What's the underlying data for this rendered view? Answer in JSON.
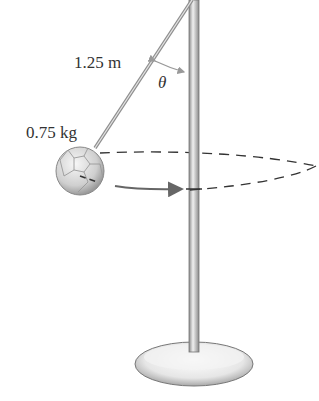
{
  "diagram": {
    "type": "conical-pendulum",
    "labels": {
      "length": "1.25 m",
      "mass": "0.75 kg",
      "angle": "θ"
    },
    "colors": {
      "background": "#ffffff",
      "pole": "#bdbdbd",
      "pole_edge": "#7a7a7a",
      "rope": "#9a9a9a",
      "ball": "#d9d9d9",
      "dash": "#333333",
      "arrow": "#666666",
      "text": "#333333"
    }
  }
}
